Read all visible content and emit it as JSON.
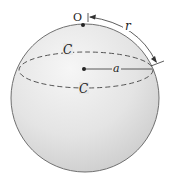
{
  "diagram": {
    "type": "sphere-geodesic-circle",
    "labels": {
      "pole": "O",
      "geodesic_radius": "r",
      "circle_top": "C",
      "circle_bottom": "C",
      "euclidean_radius": "a"
    },
    "colors": {
      "sphere_edge": "#6f6f6f",
      "sphere_fill_light": "#f4f4f4",
      "sphere_fill_dark": "#cfcfcf",
      "line": "#333333"
    }
  }
}
